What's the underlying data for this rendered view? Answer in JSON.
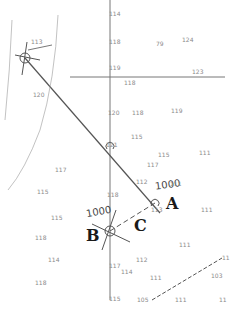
{
  "figure": {
    "type": "nautical chart plotting exercise",
    "points": {
      "A": "A",
      "B": "B",
      "C": "C"
    },
    "time_labels": {
      "at_A": "1000",
      "at_B": "1000"
    },
    "compass_rose_labels": [
      "0",
      "90",
      "80",
      "70",
      "100",
      "110",
      "120",
      "130",
      "140"
    ],
    "soundings": [
      {
        "x": 114,
        "y": 14,
        "v": "114"
      },
      {
        "x": 161,
        "y": 44,
        "v": "79"
      },
      {
        "x": 187,
        "y": 40,
        "v": "124"
      },
      {
        "x": 36,
        "y": 42,
        "v": "113"
      },
      {
        "x": 114,
        "y": 42,
        "v": "118"
      },
      {
        "x": 114,
        "y": 68,
        "v": "119"
      },
      {
        "x": 197,
        "y": 72,
        "v": "123"
      },
      {
        "x": 129,
        "y": 83,
        "v": "118"
      },
      {
        "x": 38,
        "y": 95,
        "v": "120"
      },
      {
        "x": 113,
        "y": 113,
        "v": "120"
      },
      {
        "x": 137,
        "y": 113,
        "v": "118"
      },
      {
        "x": 176,
        "y": 111,
        "v": "119"
      },
      {
        "x": 136,
        "y": 137,
        "v": "115"
      },
      {
        "x": 111,
        "y": 145,
        "v": "121"
      },
      {
        "x": 163,
        "y": 155,
        "v": "115"
      },
      {
        "x": 204,
        "y": 153,
        "v": "111"
      },
      {
        "x": 60,
        "y": 170,
        "v": "117"
      },
      {
        "x": 152,
        "y": 165,
        "v": "117"
      },
      {
        "x": 141,
        "y": 182,
        "v": "112"
      },
      {
        "x": 42,
        "y": 192,
        "v": "115"
      },
      {
        "x": 112,
        "y": 195,
        "v": "118"
      },
      {
        "x": 175,
        "y": 184,
        "v": "111"
      },
      {
        "x": 156,
        "y": 210,
        "v": "113"
      },
      {
        "x": 206,
        "y": 210,
        "v": "111"
      },
      {
        "x": 56,
        "y": 218,
        "v": "115"
      },
      {
        "x": 40,
        "y": 238,
        "v": "118"
      },
      {
        "x": 184,
        "y": 245,
        "v": "111"
      },
      {
        "x": 227,
        "y": 258,
        "v": "11"
      },
      {
        "x": 141,
        "y": 260,
        "v": "112"
      },
      {
        "x": 53,
        "y": 260,
        "v": "114"
      },
      {
        "x": 114,
        "y": 266,
        "v": "117"
      },
      {
        "x": 126,
        "y": 272,
        "v": "114"
      },
      {
        "x": 155,
        "y": 278,
        "v": "111"
      },
      {
        "x": 216,
        "y": 276,
        "v": "103"
      },
      {
        "x": 40,
        "y": 283,
        "v": "118"
      },
      {
        "x": 114,
        "y": 299,
        "v": "115"
      },
      {
        "x": 142,
        "y": 300,
        "v": "105"
      },
      {
        "x": 180,
        "y": 300,
        "v": "111"
      },
      {
        "x": 224,
        "y": 300,
        "v": "11"
      }
    ]
  }
}
